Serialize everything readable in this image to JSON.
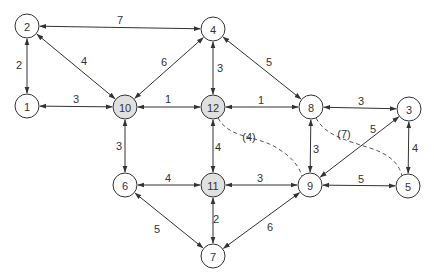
{
  "diagram": {
    "type": "weighted-graph",
    "node_radius": 12,
    "colors": {
      "stroke": "#333333",
      "node_fill": "#ffffff",
      "highlight_fill": "#e0e0e0",
      "text": "#333333"
    },
    "nodes": [
      {
        "id": "1",
        "label": "1",
        "x": 27,
        "y": 106,
        "highlight": false
      },
      {
        "id": "2",
        "label": "2",
        "x": 27,
        "y": 26,
        "highlight": false
      },
      {
        "id": "3",
        "label": "3",
        "x": 409,
        "y": 109,
        "highlight": false
      },
      {
        "id": "4",
        "label": "4",
        "x": 213,
        "y": 29,
        "highlight": false
      },
      {
        "id": "5",
        "label": "5",
        "x": 408,
        "y": 186,
        "highlight": false
      },
      {
        "id": "6",
        "label": "6",
        "x": 125,
        "y": 185,
        "highlight": false
      },
      {
        "id": "7",
        "label": "7",
        "x": 213,
        "y": 256,
        "highlight": false
      },
      {
        "id": "8",
        "label": "8",
        "x": 311,
        "y": 107,
        "highlight": false
      },
      {
        "id": "9",
        "label": "9",
        "x": 310,
        "y": 185,
        "highlight": false
      },
      {
        "id": "10",
        "label": "10",
        "x": 125,
        "y": 107,
        "highlight": true
      },
      {
        "id": "11",
        "label": "11",
        "x": 213,
        "y": 185,
        "highlight": true
      },
      {
        "id": "12",
        "label": "12",
        "x": 213,
        "y": 107,
        "highlight": true
      }
    ],
    "edges": [
      {
        "from": "2",
        "to": "4",
        "weight": "7",
        "label_x": 120,
        "label_y": 20
      },
      {
        "from": "2",
        "to": "1",
        "weight": "2",
        "label_x": 19,
        "label_y": 65
      },
      {
        "from": "2",
        "to": "10",
        "weight": "4",
        "label_x": 84,
        "label_y": 61
      },
      {
        "from": "4",
        "to": "10",
        "weight": "6",
        "label_x": 164,
        "label_y": 62
      },
      {
        "from": "4",
        "to": "12",
        "weight": "3",
        "label_x": 220,
        "label_y": 68
      },
      {
        "from": "4",
        "to": "8",
        "weight": "5",
        "label_x": 269,
        "label_y": 62
      },
      {
        "from": "1",
        "to": "10",
        "weight": "3",
        "label_x": 76,
        "label_y": 99
      },
      {
        "from": "10",
        "to": "12",
        "weight": "1",
        "label_x": 168,
        "label_y": 99
      },
      {
        "from": "12",
        "to": "8",
        "weight": "1",
        "label_x": 261,
        "label_y": 100
      },
      {
        "from": "8",
        "to": "3",
        "weight": "3",
        "label_x": 361,
        "label_y": 101
      },
      {
        "from": "10",
        "to": "6",
        "weight": "3",
        "label_x": 119,
        "label_y": 146
      },
      {
        "from": "12",
        "to": "11",
        "weight": "4",
        "label_x": 218,
        "label_y": 147
      },
      {
        "from": "8",
        "to": "9",
        "weight": "3",
        "label_x": 316,
        "label_y": 149
      },
      {
        "from": "3",
        "to": "5",
        "weight": "4",
        "label_x": 415,
        "label_y": 148
      },
      {
        "from": "3",
        "to": "9",
        "weight": "5",
        "label_x": 373,
        "label_y": 129
      },
      {
        "from": "6",
        "to": "11",
        "weight": "4",
        "label_x": 168,
        "label_y": 178
      },
      {
        "from": "11",
        "to": "9",
        "weight": "3",
        "label_x": 260,
        "label_y": 178
      },
      {
        "from": "9",
        "to": "5",
        "weight": "5",
        "label_x": 361,
        "label_y": 179
      },
      {
        "from": "6",
        "to": "7",
        "weight": "5",
        "label_x": 157,
        "label_y": 229
      },
      {
        "from": "11",
        "to": "7",
        "weight": "2",
        "label_x": 216,
        "label_y": 219
      },
      {
        "from": "9",
        "to": "7",
        "weight": "6",
        "label_x": 270,
        "label_y": 227
      }
    ],
    "dashed_edges": [
      {
        "from": "12",
        "to": "9",
        "weight": "(4)",
        "label_x": 249,
        "label_y": 137,
        "path": "M 218 118 C 230 140, 260 135, 280 150 C 296 160, 300 170, 302 176"
      },
      {
        "from": "8",
        "to": "5",
        "weight": "(7)",
        "label_x": 344,
        "label_y": 134,
        "path": "M 316 118 C 325 135, 345 140, 370 148 C 395 156, 400 168, 402 176"
      }
    ]
  }
}
